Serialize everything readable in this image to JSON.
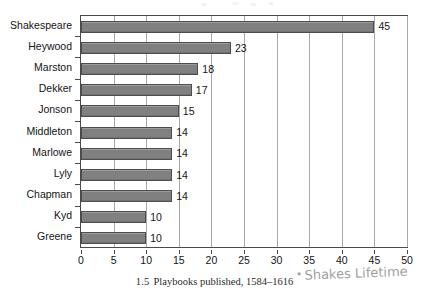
{
  "chart_data": {
    "type": "bar",
    "orientation": "horizontal",
    "title": "",
    "categories": [
      "Shakespeare",
      "Heywood",
      "Marston",
      "Dekker",
      "Jonson",
      "Middleton",
      "Marlowe",
      "Lyly",
      "Chapman",
      "Kyd",
      "Greene"
    ],
    "values": [
      45,
      23,
      18,
      17,
      15,
      14,
      14,
      14,
      14,
      10,
      10
    ],
    "value_labels": [
      "45",
      "23",
      "18",
      "17",
      "15",
      "14",
      "14",
      "14",
      "14",
      "10",
      "10"
    ],
    "xlabel": "",
    "ylabel": "",
    "xlim": [
      0,
      50
    ],
    "ylim": null,
    "xticks": [
      0,
      5,
      10,
      15,
      20,
      25,
      30,
      35,
      40,
      45,
      50
    ],
    "xtick_labels": [
      "0",
      "5",
      "10",
      "15",
      "20",
      "25",
      "30",
      "35",
      "40",
      "45",
      "50"
    ],
    "grid": "vertical",
    "legend": null,
    "bar_color": "#808080",
    "bar_edge_color": "#4d4d4d",
    "grid_color": "#a8a8a8",
    "axis_color": "#4a4a4a"
  },
  "caption": {
    "number": "1.5",
    "text": "Playbooks published, 1584–1616"
  },
  "annotation": {
    "bullet": "•",
    "text": "Shakes Lifetime"
  }
}
